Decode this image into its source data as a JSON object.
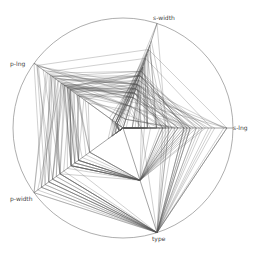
{
  "chart_data": {
    "type": "radar",
    "title": "",
    "axes": [
      "s-lng",
      "s-width",
      "p-lng",
      "p-width",
      "type"
    ],
    "axis_ranges": {
      "s-lng": [
        4.3,
        7.9
      ],
      "s-width": [
        2.0,
        4.4
      ],
      "p-lng": [
        1.0,
        6.9
      ],
      "p-width": [
        0.1,
        2.5
      ],
      "type": [
        1,
        3
      ]
    },
    "grid": "outer circle only",
    "legend": "none",
    "series_count": 150,
    "series_description": "Each line is one Iris flower record (radial parallel coordinates / star plot)",
    "sample_records": [
      [
        5.1,
        3.5,
        1.4,
        0.2,
        1
      ],
      [
        4.9,
        3.0,
        1.4,
        0.2,
        1
      ],
      [
        4.7,
        3.2,
        1.3,
        0.2,
        1
      ],
      [
        4.6,
        3.1,
        1.5,
        0.2,
        1
      ],
      [
        5.0,
        3.6,
        1.4,
        0.2,
        1
      ],
      [
        5.4,
        3.9,
        1.7,
        0.4,
        1
      ],
      [
        4.6,
        3.4,
        1.4,
        0.3,
        1
      ],
      [
        5.0,
        3.4,
        1.5,
        0.2,
        1
      ],
      [
        4.4,
        2.9,
        1.4,
        0.2,
        1
      ],
      [
        4.9,
        3.1,
        1.5,
        0.1,
        1
      ],
      [
        5.4,
        3.7,
        1.5,
        0.2,
        1
      ],
      [
        4.8,
        3.4,
        1.6,
        0.2,
        1
      ],
      [
        4.8,
        3.0,
        1.4,
        0.1,
        1
      ],
      [
        4.3,
        3.0,
        1.1,
        0.1,
        1
      ],
      [
        5.8,
        4.0,
        1.2,
        0.2,
        1
      ],
      [
        5.7,
        4.4,
        1.5,
        0.4,
        1
      ],
      [
        5.4,
        3.9,
        1.3,
        0.4,
        1
      ],
      [
        5.1,
        3.5,
        1.4,
        0.3,
        1
      ],
      [
        5.7,
        3.8,
        1.7,
        0.3,
        1
      ],
      [
        5.1,
        3.8,
        1.5,
        0.3,
        1
      ],
      [
        5.4,
        3.4,
        1.7,
        0.2,
        1
      ],
      [
        5.1,
        3.7,
        1.5,
        0.4,
        1
      ],
      [
        4.6,
        3.6,
        1.0,
        0.2,
        1
      ],
      [
        5.1,
        3.3,
        1.7,
        0.5,
        1
      ],
      [
        4.8,
        3.4,
        1.9,
        0.2,
        1
      ],
      [
        7.0,
        3.2,
        4.7,
        1.4,
        2
      ],
      [
        6.4,
        3.2,
        4.5,
        1.5,
        2
      ],
      [
        6.9,
        3.1,
        4.9,
        1.5,
        2
      ],
      [
        5.5,
        2.3,
        4.0,
        1.3,
        2
      ],
      [
        6.5,
        2.8,
        4.6,
        1.5,
        2
      ],
      [
        5.7,
        2.8,
        4.5,
        1.3,
        2
      ],
      [
        6.3,
        3.3,
        4.7,
        1.6,
        2
      ],
      [
        4.9,
        2.4,
        3.3,
        1.0,
        2
      ],
      [
        6.6,
        2.9,
        4.6,
        1.3,
        2
      ],
      [
        5.2,
        2.7,
        3.9,
        1.4,
        2
      ],
      [
        5.0,
        2.0,
        3.5,
        1.0,
        2
      ],
      [
        5.9,
        3.0,
        4.2,
        1.5,
        2
      ],
      [
        6.0,
        2.2,
        4.0,
        1.0,
        2
      ],
      [
        6.1,
        2.9,
        4.7,
        1.4,
        2
      ],
      [
        5.6,
        2.9,
        3.6,
        1.3,
        2
      ],
      [
        6.7,
        3.1,
        4.4,
        1.4,
        2
      ],
      [
        5.6,
        3.0,
        4.5,
        1.5,
        2
      ],
      [
        5.8,
        2.7,
        4.1,
        1.0,
        2
      ],
      [
        6.2,
        2.2,
        4.5,
        1.5,
        2
      ],
      [
        5.6,
        2.5,
        3.9,
        1.1,
        2
      ],
      [
        5.9,
        3.2,
        4.8,
        1.8,
        2
      ],
      [
        6.1,
        2.8,
        4.0,
        1.3,
        2
      ],
      [
        6.3,
        2.5,
        4.9,
        1.5,
        2
      ],
      [
        6.1,
        2.8,
        4.7,
        1.2,
        2
      ],
      [
        6.4,
        2.9,
        4.3,
        1.3,
        2
      ],
      [
        6.3,
        3.3,
        6.0,
        2.5,
        3
      ],
      [
        5.8,
        2.7,
        5.1,
        1.9,
        3
      ],
      [
        7.1,
        3.0,
        5.9,
        2.1,
        3
      ],
      [
        6.3,
        2.9,
        5.6,
        1.8,
        3
      ],
      [
        6.5,
        3.0,
        5.8,
        2.2,
        3
      ],
      [
        7.6,
        3.0,
        6.6,
        2.1,
        3
      ],
      [
        4.9,
        2.5,
        4.5,
        1.7,
        3
      ],
      [
        7.3,
        2.9,
        6.3,
        1.8,
        3
      ],
      [
        6.7,
        2.5,
        5.8,
        1.8,
        3
      ],
      [
        7.2,
        3.6,
        6.1,
        2.5,
        3
      ],
      [
        6.5,
        3.2,
        5.1,
        2.0,
        3
      ],
      [
        6.4,
        2.7,
        5.3,
        1.9,
        3
      ],
      [
        6.8,
        3.0,
        5.5,
        2.1,
        3
      ],
      [
        5.7,
        2.5,
        5.0,
        2.0,
        3
      ],
      [
        5.8,
        2.8,
        5.1,
        2.4,
        3
      ],
      [
        6.4,
        3.2,
        5.3,
        2.3,
        3
      ],
      [
        6.5,
        3.0,
        5.5,
        1.8,
        3
      ],
      [
        7.7,
        3.8,
        6.7,
        2.2,
        3
      ],
      [
        7.7,
        2.6,
        6.9,
        2.3,
        3
      ],
      [
        6.0,
        2.2,
        5.0,
        1.5,
        3
      ],
      [
        6.9,
        3.2,
        5.7,
        2.3,
        3
      ],
      [
        5.6,
        2.8,
        4.9,
        2.0,
        3
      ],
      [
        7.7,
        2.8,
        6.7,
        2.0,
        3
      ],
      [
        6.3,
        2.7,
        4.9,
        1.8,
        3
      ],
      [
        6.7,
        3.3,
        5.7,
        2.1,
        3
      ]
    ]
  },
  "labels": {
    "s_lng": "s-lng",
    "s_width": "s-width",
    "p_lng": "p-lng",
    "p_width": "p-width",
    "type": "type"
  },
  "geometry": {
    "center": [
      123,
      128
    ],
    "radius": 110,
    "axis_angles_deg": [
      0,
      -72,
      -144,
      144,
      72
    ],
    "inner_radius_frac": 0.0
  },
  "colors": {
    "line": "#555555",
    "circle": "#999999",
    "label": "#444444"
  }
}
